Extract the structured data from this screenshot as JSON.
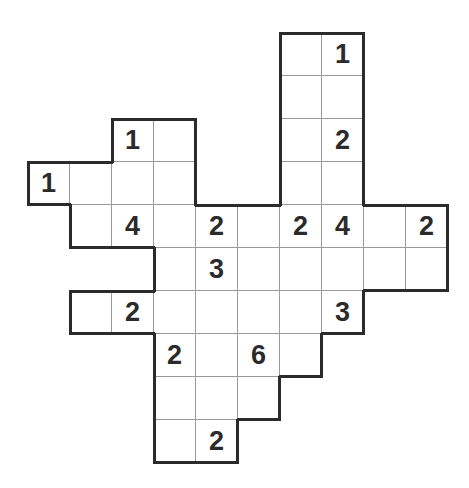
{
  "puzzle": {
    "type": "number-grid-puzzle",
    "cell_size": [
      42,
      43
    ],
    "origin": [
      28,
      33
    ],
    "rows": [
      {
        "row": 0,
        "cells": [
          {
            "col": 6,
            "value": ""
          },
          {
            "col": 7,
            "value": "1"
          }
        ]
      },
      {
        "row": 1,
        "cells": [
          {
            "col": 6,
            "value": ""
          },
          {
            "col": 7,
            "value": ""
          }
        ]
      },
      {
        "row": 2,
        "cells": [
          {
            "col": 2,
            "value": "1"
          },
          {
            "col": 3,
            "value": ""
          },
          {
            "col": 6,
            "value": ""
          },
          {
            "col": 7,
            "value": "2"
          }
        ]
      },
      {
        "row": 3,
        "cells": [
          {
            "col": 0,
            "value": "1"
          },
          {
            "col": 1,
            "value": ""
          },
          {
            "col": 2,
            "value": ""
          },
          {
            "col": 3,
            "value": ""
          },
          {
            "col": 6,
            "value": ""
          },
          {
            "col": 7,
            "value": ""
          }
        ]
      },
      {
        "row": 4,
        "cells": [
          {
            "col": 1,
            "value": ""
          },
          {
            "col": 2,
            "value": "4"
          },
          {
            "col": 3,
            "value": ""
          },
          {
            "col": 4,
            "value": "2"
          },
          {
            "col": 5,
            "value": ""
          },
          {
            "col": 6,
            "value": "2"
          },
          {
            "col": 7,
            "value": "4"
          },
          {
            "col": 8,
            "value": ""
          },
          {
            "col": 9,
            "value": "2"
          }
        ]
      },
      {
        "row": 5,
        "cells": [
          {
            "col": 3,
            "value": ""
          },
          {
            "col": 4,
            "value": "3"
          },
          {
            "col": 5,
            "value": ""
          },
          {
            "col": 6,
            "value": ""
          },
          {
            "col": 7,
            "value": ""
          },
          {
            "col": 8,
            "value": ""
          },
          {
            "col": 9,
            "value": ""
          }
        ]
      },
      {
        "row": 6,
        "cells": [
          {
            "col": 1,
            "value": ""
          },
          {
            "col": 2,
            "value": "2"
          },
          {
            "col": 3,
            "value": ""
          },
          {
            "col": 4,
            "value": ""
          },
          {
            "col": 5,
            "value": ""
          },
          {
            "col": 6,
            "value": ""
          },
          {
            "col": 7,
            "value": "3"
          }
        ]
      },
      {
        "row": 7,
        "cells": [
          {
            "col": 3,
            "value": "2"
          },
          {
            "col": 4,
            "value": ""
          },
          {
            "col": 5,
            "value": "6"
          },
          {
            "col": 6,
            "value": ""
          }
        ]
      },
      {
        "row": 8,
        "cells": [
          {
            "col": 3,
            "value": ""
          },
          {
            "col": 4,
            "value": ""
          },
          {
            "col": 5,
            "value": ""
          }
        ]
      },
      {
        "row": 9,
        "cells": [
          {
            "col": 3,
            "value": ""
          },
          {
            "col": 4,
            "value": "2"
          }
        ]
      }
    ],
    "colors": {
      "outline": "#2b2b2b",
      "gridline": "#9a9a9a",
      "digit": "#2b2b2b",
      "background": "#ffffff"
    }
  }
}
